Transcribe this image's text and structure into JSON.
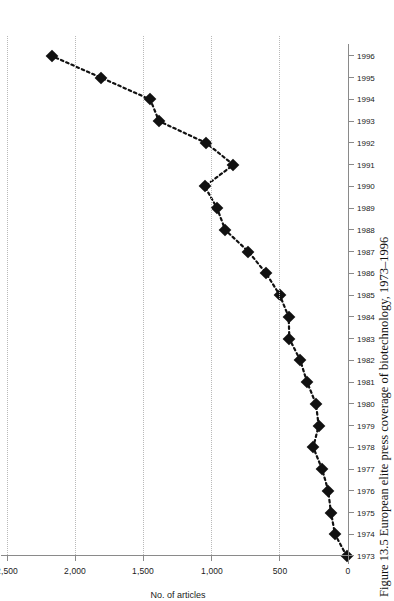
{
  "figure": {
    "caption": "Figure 13.5 European elite press coverage of biotechnology, 1973–1996",
    "orientation": "rotated-90-ccw"
  },
  "chart_data": {
    "type": "line",
    "title": "",
    "subtitle": "",
    "xlabel": "",
    "ylabel": "No. of articles",
    "categories": [
      "1973",
      "1974",
      "1975",
      "1976",
      "1977",
      "1978",
      "1979",
      "1980",
      "1981",
      "1982",
      "1983",
      "1984",
      "1985",
      "1986",
      "1987",
      "1988",
      "1989",
      "1990",
      "1991",
      "1992",
      "1993",
      "1994",
      "1995",
      "1996"
    ],
    "x": [
      1973,
      1974,
      1975,
      1976,
      1977,
      1978,
      1979,
      1980,
      1981,
      1982,
      1983,
      1984,
      1985,
      1986,
      1987,
      1988,
      1989,
      1990,
      1991,
      1992,
      1993,
      1994,
      1995,
      1996
    ],
    "values": [
      10,
      95,
      125,
      145,
      190,
      255,
      215,
      235,
      300,
      350,
      430,
      435,
      500,
      600,
      730,
      900,
      960,
      1050,
      840,
      1040,
      1385,
      1450,
      1810,
      2170
    ],
    "series": [
      {
        "name": "No. of articles",
        "values": [
          10,
          95,
          125,
          145,
          190,
          255,
          215,
          235,
          300,
          350,
          430,
          435,
          500,
          600,
          730,
          900,
          960,
          1050,
          840,
          1040,
          1385,
          1450,
          1810,
          2170
        ]
      }
    ],
    "ylim": [
      0,
      2500
    ],
    "yticks": [
      0,
      500,
      1000,
      1500,
      2000,
      2500
    ],
    "ytick_labels": [
      "0",
      "500",
      "1,000",
      "1,500",
      "2,000",
      "2,500"
    ],
    "grid": "y-gridlines-dotted",
    "legend": "none",
    "marker": "filled-diamond",
    "line_style": "dotted",
    "line_color": "#111111",
    "marker_color": "#111111",
    "axis_color": "#8a8a8a",
    "grid_color": "#b9b9b9"
  },
  "axes": {
    "y_title": "No. of articles",
    "y_labels": [
      "0",
      "500",
      "1,000",
      "1,500",
      "2,000",
      "2,500"
    ],
    "x_labels": [
      "1973",
      "1974",
      "1975",
      "1976",
      "1977",
      "1978",
      "1979",
      "1980",
      "1981",
      "1982",
      "1983",
      "1984",
      "1985",
      "1986",
      "1987",
      "1988",
      "1989",
      "1990",
      "1991",
      "1992",
      "1993",
      "1994",
      "1995",
      "1996"
    ]
  }
}
